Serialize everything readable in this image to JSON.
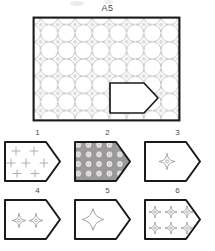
{
  "puzzle": {
    "title": "A5",
    "type": "pattern-completion-visual-reasoning"
  },
  "colors": {
    "border": "#1a1a1a",
    "motif_stroke": "#a8a6a8",
    "motif_fill": "#ffffff",
    "option_border": "#1a1a1a",
    "option2_background": "#9c9a9a",
    "option2_circle_fill": "#f2f0ee",
    "cross_stroke": "#b0aeae",
    "paper": "#ffffff",
    "text": "#4a4a4a"
  },
  "stimulus": {
    "name": "A5",
    "shape": "rectangle",
    "fill_pattern": "four-pointed-star-tile",
    "pattern_columns": 9,
    "pattern_rows": 6,
    "cutout": {
      "shape": "pentagon-pointed-right",
      "fill": "blank",
      "position": "lower-right"
    }
  },
  "options": [
    {
      "number": "1",
      "shape": "pentagon-pointed-right",
      "content": "plus-crosses",
      "count": 7,
      "background": "white"
    },
    {
      "number": "2",
      "shape": "pentagon-pointed-right",
      "content": "circle-grid",
      "count": 20,
      "background": "gray"
    },
    {
      "number": "3",
      "shape": "pentagon-pointed-right",
      "content": "four-pointed-star",
      "count": 1,
      "background": "white"
    },
    {
      "number": "4",
      "shape": "pentagon-pointed-right",
      "content": "four-pointed-star",
      "count": 2,
      "background": "white"
    },
    {
      "number": "5",
      "shape": "pentagon-pointed-right",
      "content": "four-pointed-star-large",
      "count": 1,
      "background": "white"
    },
    {
      "number": "6",
      "shape": "pentagon-pointed-right",
      "content": "four-pointed-star",
      "count": 6,
      "background": "white"
    }
  ]
}
